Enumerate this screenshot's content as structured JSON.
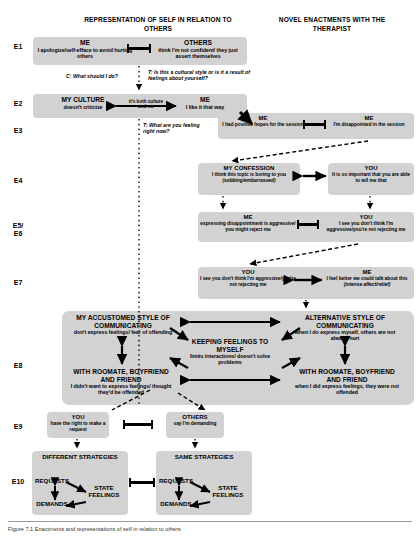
{
  "headers": {
    "left": "REPRESENTATION OF SELF IN RELATION TO OTHERS",
    "right": "NOVEL ENACTMENTS WITH THE THERAPIST"
  },
  "row_labels": {
    "e1": "E1",
    "e2": "E2",
    "e3": "E3",
    "e4": "E4",
    "e5e6": "E5/\nE6",
    "e7": "E7",
    "e8": "E8",
    "e9": "E9",
    "e10": "E10"
  },
  "e1": {
    "me_title": "ME",
    "me_sub": "I apologize/self-efface to avoid hurting others",
    "others_title": "OTHERS",
    "others_sub": "think I'm not confident/ they just assert themselves"
  },
  "annotations": {
    "client_what_should_i_do": "C: What should I do?",
    "therapist_cultural_style": "T: Is this a cultural style or is it a result of feelings about yourself?",
    "therapist_feeling_right_now": "T: What are you feeling right now?"
  },
  "e2": {
    "culture_title": "MY CULTURE",
    "culture_sub": "doesn't criticize",
    "arrow_label": "it's both culture and me",
    "me_title": "ME",
    "me_sub": "I like it that way"
  },
  "e3": {
    "hopes_title": "ME",
    "hopes_sub": "I had positive hopes for the session",
    "disappointed_title": "ME",
    "disappointed_sub": "I'm disappointed in the session"
  },
  "e4": {
    "confession_title": "MY CONFESSION",
    "confession_sub": "I think this topic is boring to you",
    "confession_sub_italic": "(sobbing/embarrassed)",
    "you_title": "YOU",
    "you_sub": "It is so important that you are able to tell me that"
  },
  "e5e6": {
    "me_title": "ME",
    "me_sub": "expressing disappointment is aggressive/ you might reject me",
    "you_title": "YOU",
    "you_sub": "I see you don't think I'm aggressive/you're not rejecting me"
  },
  "e7": {
    "you_title": "YOU",
    "you_sub": "I see you don't think I'm aggressive/you're not rejecting me",
    "me_title": "ME",
    "me_sub": "I feel better we could talk about this",
    "me_sub_italic": "(intense affect/relief)"
  },
  "e8": {
    "accustomed_title": "MY ACCUSTOMED STYLE OF COMMUNICATING",
    "accustomed_sub": "don't express feelings/ fear of offending",
    "keeping_title": "KEEPING FEELINGS TO MYSELF",
    "keeping_sub": "limits interactions/ doesn't solve problems",
    "alternative_title": "ALTERNATIVE STYLE OF COMMUNICATING",
    "alternative_sub": "when I do express myself, others are not always hurt",
    "roommate_left_title": "WITH ROOMATE, BOYFRIEND AND FRIEND",
    "roommate_left_sub": "I didn't want to express feelings/ thought they'd be offended",
    "roommate_right_title": "WITH ROOMATE, BOYFRIEND AND FRIEND",
    "roommate_right_sub": "when I did express feelings, they were not offended"
  },
  "e9": {
    "you_title": "YOU",
    "you_sub": "have the right to make a request",
    "others_title": "OTHERS",
    "others_sub": "say I'm demanding"
  },
  "e10": {
    "different_title": "DIFFERENT STRATEGIES",
    "same_title": "SAME STRATEGIES",
    "requests": "REQUESTS",
    "state_feelings": "STATE FEELINGS",
    "demands": "DEMANDS"
  },
  "caption": {
    "text": "Figure 7.1  Enactments and representations of self in relation to others"
  },
  "colors": {
    "box_fill": "#d2d2d2",
    "line": "#000000",
    "page_bg": "#ffffff"
  }
}
